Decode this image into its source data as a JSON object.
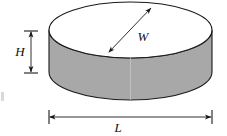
{
  "figure": {
    "shape": "cylinder",
    "orientation": "flat-disc-horizontal",
    "labels": {
      "height": "H",
      "width": "W",
      "length": "L"
    },
    "colors": {
      "body_fill": "#a8a8a8",
      "top_fill": "#ffffff",
      "outline": "#1a1a1a",
      "dimension_line": "#1a1a1a",
      "background": "#ffffff"
    },
    "geometry": {
      "cylinder_left_x": 49,
      "cylinder_right_x": 212,
      "top_ellipse_center_y": 30,
      "top_ellipse_rx": 81.5,
      "top_ellipse_ry": 28,
      "bottom_ellipse_center_y": 72,
      "bottom_ellipse_rx": 81.5,
      "bottom_ellipse_ry": 28,
      "body_height": 42
    },
    "dimensions": [
      {
        "name": "height-dimension",
        "label": "H",
        "type": "vertical-double-arrow",
        "x": 31,
        "y_start": 31,
        "y_end": 73,
        "label_x": 20,
        "label_y": 56
      },
      {
        "name": "width-dimension",
        "label": "W",
        "type": "diagonal-double-arrow",
        "x_start": 108,
        "y_start": 53,
        "x_end": 152,
        "y_end": 7,
        "label_x": 137,
        "label_y": 41
      },
      {
        "name": "length-dimension",
        "label": "L",
        "type": "horizontal-double-arrow",
        "y": 117,
        "x_start": 49,
        "x_end": 212,
        "label_x": 114,
        "label_y": 132
      }
    ]
  }
}
